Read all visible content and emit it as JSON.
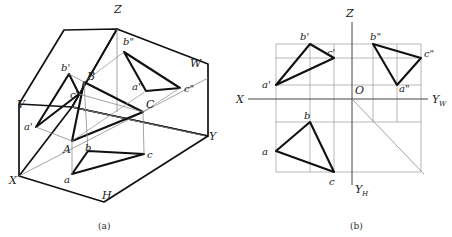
{
  "figure": {
    "captions": [
      {
        "id": "caption-a",
        "text": "(a)",
        "x": 98,
        "y": 228
      },
      {
        "id": "caption-b",
        "text": "(b)",
        "x": 350,
        "y": 228
      }
    ],
    "colors": {
      "heavy_line": "#111111",
      "thin_line": "#6b6b6b",
      "projection_line": "#8c8c8c",
      "text": "#1a1a1a",
      "background": "#ffffff"
    }
  },
  "panel_a": {
    "name": "pictorial-view",
    "caption": "(a)",
    "plane_labels": [
      {
        "id": "plane-V",
        "text": "V",
        "x": 17,
        "y": 108
      },
      {
        "id": "plane-H",
        "text": "H",
        "x": 102,
        "y": 199
      },
      {
        "id": "plane-W",
        "text": "W",
        "x": 190,
        "y": 67
      }
    ],
    "axis_labels": [
      {
        "id": "axis-Z",
        "text": "Z",
        "x": 114,
        "y": 13
      },
      {
        "id": "axis-X",
        "text": "X",
        "x": 9,
        "y": 184
      },
      {
        "id": "axis-Y",
        "text": "Y",
        "x": 209,
        "y": 140
      }
    ],
    "point_labels": [
      {
        "id": "pt-A",
        "text": "A",
        "x": 63,
        "y": 153
      },
      {
        "id": "pt-B",
        "text": "B",
        "x": 87,
        "y": 80
      },
      {
        "id": "pt-C",
        "text": "C",
        "x": 146,
        "y": 108
      },
      {
        "id": "pt-a-prime",
        "text": "a'",
        "x": 24,
        "y": 130
      },
      {
        "id": "pt-b-prime",
        "text": "b'",
        "x": 63,
        "y": 71
      },
      {
        "id": "pt-c-prime",
        "text": "c'",
        "x": 70,
        "y": 97
      },
      {
        "id": "pt-a-h",
        "text": "a",
        "x": 64,
        "y": 182
      },
      {
        "id": "pt-b-h",
        "text": "b",
        "x": 85,
        "y": 151
      },
      {
        "id": "pt-c-h",
        "text": "c",
        "x": 147,
        "y": 158
      },
      {
        "id": "pt-a-double",
        "text": "a\"",
        "x": 134,
        "y": 89
      },
      {
        "id": "pt-b-double",
        "text": "b\"",
        "x": 126,
        "y": 45
      },
      {
        "id": "pt-c-double",
        "text": "c\"",
        "x": 187,
        "y": 91
      }
    ],
    "vertices": {
      "A": [
        72,
        141
      ],
      "B": [
        84,
        82
      ],
      "C": [
        143,
        112
      ],
      "a_prime": [
        36,
        127
      ],
      "b_prime": [
        69,
        74
      ],
      "c_prime": [
        79,
        94
      ],
      "a_h": [
        72,
        174
      ],
      "b_h": [
        88,
        151
      ],
      "c_h": [
        144,
        154
      ],
      "a_dd": [
        146,
        91
      ],
      "b_dd": [
        124,
        52
      ],
      "c_dd": [
        180,
        88
      ]
    },
    "box": {
      "origin": [
        72,
        107
      ],
      "z_top": [
        117,
        29
      ],
      "x_corner": [
        19,
        176
      ],
      "y_corner": [
        205,
        136
      ],
      "h_bottom": [
        104,
        202
      ],
      "v_topleft": [
        64,
        30
      ],
      "v_bottomleft": [
        19,
        104
      ],
      "w_topright": [
        208,
        64
      ],
      "w_bottomright": [
        208,
        136
      ]
    }
  },
  "panel_b": {
    "name": "orthographic-projection-view",
    "caption": "(b)",
    "axis_labels": [
      {
        "id": "axis-Z",
        "text": "Z",
        "x": 346,
        "y": 16
      },
      {
        "id": "axis-X",
        "text": "X",
        "x": 239,
        "y": 103
      },
      {
        "id": "axis-YW",
        "text": "Y",
        "sub": "W",
        "x": 433,
        "y": 103
      },
      {
        "id": "axis-YH",
        "text": "Y",
        "sub": "H",
        "x": 355,
        "y": 192
      },
      {
        "id": "origin-O",
        "text": "O",
        "x": 356,
        "y": 94
      }
    ],
    "point_labels": [
      {
        "id": "pt-a-prime",
        "text": "a'",
        "x": 262,
        "y": 87
      },
      {
        "id": "pt-b-prime",
        "text": "b'",
        "x": 299,
        "y": 40
      },
      {
        "id": "pt-c-prime",
        "text": "c'",
        "x": 327,
        "y": 56
      },
      {
        "id": "pt-a-double",
        "text": "a\"",
        "x": 399,
        "y": 91
      },
      {
        "id": "pt-b-double",
        "text": "b\"",
        "x": 372,
        "y": 41
      },
      {
        "id": "pt-c-double",
        "text": "c\"",
        "x": 424,
        "y": 57
      },
      {
        "id": "pt-a-h",
        "text": "a",
        "x": 263,
        "y": 155
      },
      {
        "id": "pt-b-h",
        "text": "b",
        "x": 304,
        "y": 119
      },
      {
        "id": "pt-c-h",
        "text": "c",
        "x": 329,
        "y": 184
      }
    ],
    "vertices": {
      "a_prime": [
        276,
        85
      ],
      "b_prime": [
        310,
        44
      ],
      "c_prime": [
        334,
        58
      ],
      "a_dd": [
        397,
        85
      ],
      "b_dd": [
        373,
        44
      ],
      "c_dd": [
        421,
        58
      ],
      "a_h": [
        276,
        151
      ],
      "b_h": [
        310,
        122
      ],
      "c_h": [
        334,
        172
      ]
    },
    "axes": {
      "x_axis": {
        "x1": 248,
        "y1": 99,
        "x2": 428,
        "y2": 99
      },
      "z_axis": {
        "x1": 352,
        "y1": 22,
        "x2": 352,
        "y2": 99
      },
      "yh_axis": {
        "x1": 352,
        "y1": 99,
        "x2": 352,
        "y2": 185
      },
      "bisector": {
        "x1": 352,
        "y1": 99,
        "x2": 421,
        "y2": 172
      }
    },
    "grid_h_lines": [
      44,
      58,
      85,
      122,
      172
    ],
    "grid_v_lines": [
      276,
      310,
      334,
      373,
      397,
      421
    ]
  }
}
